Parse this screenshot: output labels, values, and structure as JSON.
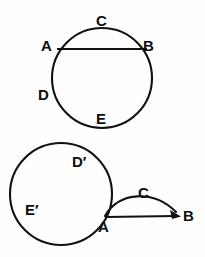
{
  "figure": {
    "background_color": "#fefefe",
    "stroke_color": "#111111",
    "width": 205,
    "height": 257
  },
  "top_figure": {
    "name": "circle-with-chord",
    "circle": {
      "cx": 102,
      "cy": 78,
      "r": 50
    },
    "chord": {
      "x1": 57,
      "y1": 49,
      "x2": 147,
      "y2": 49
    },
    "labels": {
      "a": "A",
      "b": "B",
      "c": "C",
      "d": "D",
      "e": "E"
    }
  },
  "bottom_figure": {
    "name": "circle-with-detached-arc",
    "circle": {
      "cx": 61,
      "cy": 194,
      "r": 51
    },
    "arc": {
      "x1": 105,
      "y1": 216,
      "x2": 180,
      "y2": 216,
      "rx": 42,
      "ry": 26
    },
    "arrow_line": {
      "x1": 105,
      "y1": 217,
      "x2": 179,
      "y2": 216
    },
    "labels": {
      "a": "A",
      "b": "B",
      "c": "C",
      "d_prime": "D′",
      "e_prime": "E′"
    }
  }
}
